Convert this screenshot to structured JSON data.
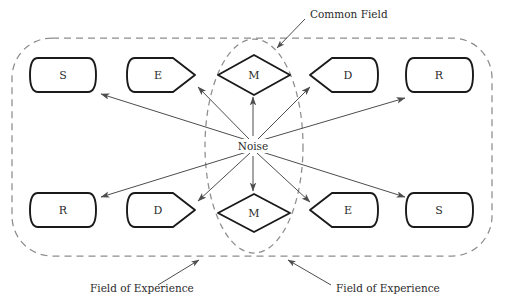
{
  "diagram": {
    "center": {
      "label": "Noise",
      "x": 253,
      "y": 146
    },
    "nodes": [
      {
        "id": "s-top-left",
        "label": "S",
        "shape": "rounded-rect",
        "x": 30,
        "y": 58,
        "w": 66,
        "h": 34,
        "row": "top",
        "name": "node-source-top-left"
      },
      {
        "id": "e-top-left",
        "label": "E",
        "shape": "point-right",
        "x": 127,
        "y": 58,
        "w": 68,
        "h": 34,
        "row": "top",
        "name": "node-encoder-top-left"
      },
      {
        "id": "m-top",
        "label": "M",
        "shape": "diamond",
        "x": 218,
        "y": 55,
        "w": 72,
        "h": 38,
        "row": "top",
        "name": "node-message-top"
      },
      {
        "id": "d-top-right",
        "label": "D",
        "shape": "point-left",
        "x": 310,
        "y": 58,
        "w": 68,
        "h": 34,
        "row": "top",
        "name": "node-decoder-top-right"
      },
      {
        "id": "r-top-right",
        "label": "R",
        "shape": "rounded-rect",
        "x": 406,
        "y": 58,
        "w": 67,
        "h": 34,
        "row": "top",
        "name": "node-receiver-top-right"
      },
      {
        "id": "r-bottom-left",
        "label": "R",
        "shape": "rounded-rect",
        "x": 30,
        "y": 193,
        "w": 66,
        "h": 34,
        "row": "bottom",
        "name": "node-receiver-bottom-left"
      },
      {
        "id": "d-bottom-left",
        "label": "D",
        "shape": "point-right",
        "x": 127,
        "y": 193,
        "w": 68,
        "h": 34,
        "row": "bottom",
        "name": "node-decoder-bottom-left"
      },
      {
        "id": "m-bottom",
        "label": "M",
        "shape": "diamond",
        "x": 218,
        "y": 194,
        "w": 72,
        "h": 38,
        "row": "bottom",
        "name": "node-message-bottom"
      },
      {
        "id": "d-bottom-right",
        "label": "E",
        "shape": "point-left",
        "x": 310,
        "y": 193,
        "w": 68,
        "h": 34,
        "row": "bottom",
        "name": "node-encoder-bottom-right"
      },
      {
        "id": "s-bottom-right",
        "label": "S",
        "shape": "rounded-rect",
        "x": 406,
        "y": 193,
        "w": 67,
        "h": 34,
        "row": "bottom",
        "name": "node-source-bottom-right"
      }
    ],
    "arrows": [
      {
        "id": "noise-to-s-top-left",
        "from": [
          253,
          146
        ],
        "to": [
          99,
          93
        ],
        "name": "arrow-noise-to-source-top-left"
      },
      {
        "id": "noise-to-e-top-left",
        "from": [
          253,
          146
        ],
        "to": [
          196,
          85
        ],
        "name": "arrow-noise-to-encoder-top-left"
      },
      {
        "id": "noise-to-m-top",
        "from": [
          253,
          146
        ],
        "to": [
          253,
          96
        ],
        "name": "arrow-noise-to-message-top"
      },
      {
        "id": "noise-to-d-top-right",
        "from": [
          253,
          146
        ],
        "to": [
          309,
          85
        ],
        "name": "arrow-noise-to-decoder-top-right"
      },
      {
        "id": "noise-to-r-top-right",
        "from": [
          253,
          146
        ],
        "to": [
          404,
          97
        ],
        "name": "arrow-noise-to-receiver-top-right"
      },
      {
        "id": "noise-to-r-bottom-left",
        "from": [
          253,
          146
        ],
        "to": [
          99,
          198
        ],
        "name": "arrow-noise-to-receiver-bottom-left"
      },
      {
        "id": "noise-to-d-bottom-left",
        "from": [
          253,
          146
        ],
        "to": [
          196,
          202
        ],
        "name": "arrow-noise-to-decoder-bottom-left"
      },
      {
        "id": "noise-to-m-bottom",
        "from": [
          253,
          146
        ],
        "to": [
          253,
          192
        ],
        "name": "arrow-noise-to-message-bottom"
      },
      {
        "id": "noise-to-e-bottom-right",
        "from": [
          253,
          146
        ],
        "to": [
          309,
          203
        ],
        "name": "arrow-noise-to-encoder-bottom-right"
      },
      {
        "id": "noise-to-s-bottom-right",
        "from": [
          253,
          146
        ],
        "to": [
          404,
          198
        ],
        "name": "arrow-noise-to-source-bottom-right"
      }
    ],
    "boundaries": {
      "outer": {
        "x": 12,
        "y": 38,
        "w": 480,
        "h": 218,
        "rx": 40,
        "label": "field-of-experience-boundary"
      },
      "common_field": {
        "cx": 254,
        "cy": 146,
        "rx": 49,
        "ry": 107
      }
    },
    "annotations": [
      {
        "id": "common-field",
        "text": "Common Field",
        "text_x": 310,
        "text_y": 15,
        "leader": {
          "from": [
            305,
            18
          ],
          "to": [
            276,
            49
          ]
        },
        "name": "annotation-common-field"
      },
      {
        "id": "field-of-experience-left",
        "text": "Field of Experience",
        "text_x": 90,
        "text_y": 292,
        "leader": {
          "from": [
            156,
            284
          ],
          "to": [
            200,
            259
          ]
        },
        "name": "annotation-field-of-experience-left"
      },
      {
        "id": "field-of-experience-right",
        "text": "Field of Experience",
        "text_x": 335,
        "text_y": 292,
        "leader": {
          "from": [
            330,
            284
          ],
          "to": [
            287,
            259
          ]
        },
        "name": "annotation-field-of-experience-right"
      }
    ],
    "colors": {
      "node_stroke": "#1a1a1a",
      "dashed_stroke": "#8d8d8d",
      "arrow_stroke": "#4d4d4d",
      "text": "#2b2b2b",
      "background": "#ffffff"
    }
  }
}
